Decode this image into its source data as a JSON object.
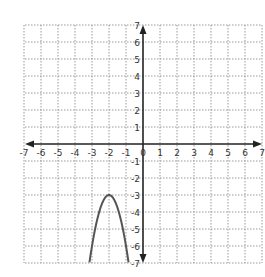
{
  "chart_data": {
    "type": "line",
    "title": "",
    "xlabel": "",
    "ylabel": "",
    "xlim": [
      -7,
      7
    ],
    "ylim": [
      -7,
      7
    ],
    "grid": true,
    "grid_style": "dotted",
    "x_ticks": [
      -7,
      -6,
      -5,
      -4,
      -3,
      -2,
      -1,
      0,
      1,
      2,
      3,
      4,
      5,
      6,
      7
    ],
    "y_ticks": [
      -7,
      -6,
      -5,
      -4,
      -3,
      -2,
      -1,
      1,
      2,
      3,
      4,
      5,
      6,
      7
    ],
    "x_tick_labels": [
      "-7",
      "-6",
      "-5",
      "-4",
      "-3",
      "-2",
      "-1",
      "0",
      "1",
      "2",
      "3",
      "4",
      "5",
      "6",
      "7"
    ],
    "y_tick_labels": [
      "7",
      "6",
      "5",
      "4",
      "3",
      "2",
      "1",
      "-1",
      "-2",
      "-3",
      "-4",
      "-5",
      "-6",
      "-7"
    ],
    "series": [
      {
        "name": "parabola",
        "equation": "y = -3(x + 2)^2 - 3",
        "vertex": [
          -2,
          -3
        ],
        "opens": "down",
        "x": [
          -3.15,
          -3.0,
          -2.75,
          -2.5,
          -2.25,
          -2.0,
          -1.75,
          -1.5,
          -1.25,
          -1.0,
          -0.85
        ],
        "y": [
          -6.97,
          -6.0,
          -4.69,
          -3.75,
          -3.19,
          -3.0,
          -3.19,
          -3.75,
          -4.69,
          -6.0,
          -6.97
        ],
        "color": "#555555"
      }
    ],
    "legend": null
  },
  "colors": {
    "axis": "#222222",
    "grid": "#9a9a9a",
    "curve": "#555555"
  }
}
